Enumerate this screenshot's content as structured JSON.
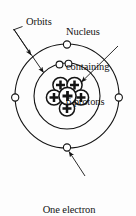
{
  "diagram": {
    "background_color": "#fdfdfd",
    "stroke_color": "#141414",
    "fill_color": "#ffffff",
    "labels": {
      "orbits": "Orbits",
      "nucleus_line1": "Nucleus",
      "nucleus_line2": "containing",
      "nucleus_line3": "6 protons",
      "electron_line1": "One electron",
      "electron_line2": "(a total of 6)"
    },
    "nucleus": {
      "proton_count": 6,
      "proton_symbol": "+",
      "protons": [
        {
          "cx": 60.5,
          "cy": 85.0,
          "r": 7.6
        },
        {
          "cx": 74.5,
          "cy": 85.0,
          "r": 7.6
        },
        {
          "cx": 54.0,
          "cy": 97.5,
          "r": 7.6
        },
        {
          "cx": 67.5,
          "cy": 96.0,
          "r": 8.6
        },
        {
          "cx": 81.0,
          "cy": 97.5,
          "r": 7.6
        },
        {
          "cx": 67.0,
          "cy": 108.5,
          "r": 7.6
        }
      ]
    },
    "orbits": [
      {
        "name": "outer-orbit",
        "cx": 67,
        "cy": 96,
        "r": 52
      },
      {
        "name": "inner-orbit",
        "cx": 67,
        "cy": 96,
        "r": 33
      }
    ],
    "electrons": [
      {
        "name": "electron-outer-top",
        "cx": 67,
        "cy": 44.5,
        "r": 3.6
      },
      {
        "name": "electron-outer-left",
        "cx": 15.2,
        "cy": 97.5,
        "r": 3.6
      },
      {
        "name": "electron-outer-right",
        "cx": 118.8,
        "cy": 97.5,
        "r": 3.6
      },
      {
        "name": "electron-outer-bottom",
        "cx": 67,
        "cy": 147.5,
        "r": 3.6
      },
      {
        "name": "electron-inner-left",
        "cx": 59.5,
        "cy": 64.5,
        "r": 3.4
      },
      {
        "name": "electron-inner-right",
        "cx": 68.5,
        "cy": 63.6,
        "r": 3.4
      }
    ],
    "leaders": [
      {
        "name": "leader-orbits-outer",
        "x1": 15.5,
        "y1": 30.5,
        "x2": 32.0,
        "y2": 56.0
      },
      {
        "name": "leader-orbits-inner",
        "x1": 15.5,
        "y1": 30.5,
        "x2": 45.0,
        "y2": 73.5
      },
      {
        "name": "leader-orbits-tick",
        "x1": 13.0,
        "y1": 30.0,
        "x2": 22.5,
        "y2": 26.5
      },
      {
        "name": "leader-nucleus",
        "x1": 117.0,
        "y1": 47.0,
        "x2": 80.5,
        "y2": 83.0
      },
      {
        "name": "leader-electron",
        "x1": 84.0,
        "y1": 174.0,
        "x2": 68.5,
        "y2": 151.0
      }
    ]
  }
}
